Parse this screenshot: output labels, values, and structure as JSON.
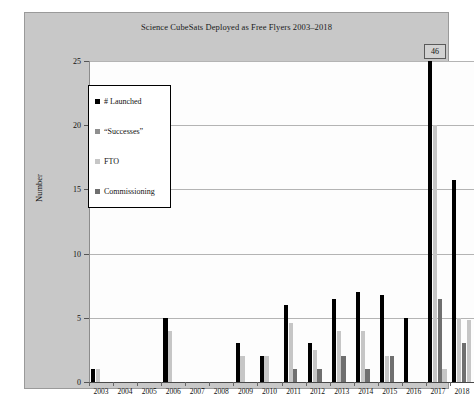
{
  "chart_data": {
    "type": "bar",
    "title": "Science CubeSats Deployed as Free Flyers 2003–2018",
    "xlabel": "",
    "ylabel": "Number",
    "ylim": [
      0,
      25
    ],
    "ytick_values": [
      0,
      5,
      10,
      15,
      20,
      25
    ],
    "ytick_labels": [
      "0",
      "5",
      "10",
      "15",
      "20",
      "25"
    ],
    "grid": true,
    "legend_position": "upper-left",
    "categories": [
      "2003",
      "2004",
      "2005",
      "2006",
      "2007",
      "2008",
      "2009",
      "2010",
      "2011",
      "2012",
      "2013",
      "2014",
      "2015",
      "2016",
      "2017",
      "2018"
    ],
    "series": [
      {
        "name": "# Launched",
        "color": "#000000",
        "values": [
          1,
          0,
          0,
          5,
          0,
          0,
          3,
          2,
          6,
          3,
          6.5,
          7,
          6.8,
          5,
          25,
          15.7
        ],
        "clipped_points": [
          {
            "category": "2017",
            "actual_value": 46,
            "label": "46"
          }
        ]
      },
      {
        "name": "“Successes”",
        "color": "#8f8f8f",
        "values": [
          0,
          0,
          0,
          0,
          0,
          0,
          0,
          0,
          0,
          0,
          0,
          0,
          0,
          0,
          0,
          0
        ]
      },
      {
        "name": "FTO",
        "color": "#c6c6c6",
        "values": [
          1,
          0,
          0,
          4,
          0,
          0,
          2,
          2,
          4.6,
          2.5,
          4,
          4,
          2,
          0,
          20,
          5
        ],
        "note": "light grey second bar in each group"
      },
      {
        "name": "Commissioning",
        "color": "#6f6f6f",
        "values": [
          0,
          0,
          0,
          0,
          0,
          0,
          0,
          0,
          1,
          1,
          2,
          1,
          2,
          0,
          6.5,
          3
        ],
        "note": "darker grey small bars"
      }
    ],
    "extra_bars": {
      "2017": [
        {
          "series": "FTO",
          "value": 1
        }
      ],
      "2018": [
        {
          "series": "FTO",
          "value": 4.8
        }
      ]
    },
    "annotations": [
      {
        "text": "46",
        "category": "2017",
        "kind": "value-callout-box"
      }
    ]
  },
  "legend": {
    "items": [
      {
        "label": "# Launched",
        "swatch": "sw-launched"
      },
      {
        "label": "“Successes”",
        "swatch": "sw-successes"
      },
      {
        "label": "FTO",
        "swatch": "sw-fto"
      },
      {
        "label": "Commissioning",
        "swatch": "sw-commissioning"
      }
    ]
  },
  "callout": {
    "value": "46"
  }
}
